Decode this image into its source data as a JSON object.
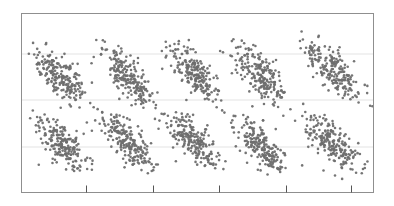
{
  "chart_data": {
    "type": "scatter",
    "title": "",
    "subtitle": "",
    "xlabel": "",
    "ylabel": "",
    "xlim": [
      0,
      100
    ],
    "ylim": [
      0,
      100
    ],
    "grid": true,
    "grid_axis": "y",
    "grid_color": "#e3e3e3",
    "legend": null,
    "legend_position": "none",
    "xticklabels": [],
    "yticklabels": [],
    "marker": {
      "shape": "circle",
      "color": "#6e6e6e",
      "size_px": 2.6,
      "opacity": 0.95
    },
    "frame": {
      "border_color": "#8f8f8f",
      "border_width": 1,
      "left_px": 21,
      "top_px": 13,
      "right_px": 374,
      "bottom_px": 193
    },
    "x_ticks_px": [
      86,
      153,
      219,
      286,
      351
    ],
    "x_tick_direction": "inward",
    "x_tick_length_px": 7,
    "y_gridlines_px": [
      54,
      100,
      147
    ],
    "n_points": 2100,
    "cycles": 5,
    "period_px": 66,
    "series": [
      {
        "name": "points",
        "color": "#6e6e6e",
        "bands": [
          {
            "band": "upper",
            "cycle": 1,
            "x_start_px": 28,
            "x_end_px": 95,
            "y_start_px": 48,
            "y_end_px": 108
          },
          {
            "band": "lower",
            "cycle": 1,
            "x_start_px": 28,
            "x_end_px": 95,
            "y_start_px": 112,
            "y_end_px": 175
          },
          {
            "band": "upper",
            "cycle": 2,
            "x_start_px": 94,
            "x_end_px": 161,
            "y_start_px": 42,
            "y_end_px": 108
          },
          {
            "band": "lower",
            "cycle": 2,
            "x_start_px": 94,
            "x_end_px": 161,
            "y_start_px": 110,
            "y_end_px": 172
          },
          {
            "band": "upper",
            "cycle": 3,
            "x_start_px": 160,
            "x_end_px": 227,
            "y_start_px": 42,
            "y_end_px": 108
          },
          {
            "band": "lower",
            "cycle": 3,
            "x_start_px": 160,
            "x_end_px": 227,
            "y_start_px": 110,
            "y_end_px": 172
          },
          {
            "band": "upper",
            "cycle": 4,
            "x_start_px": 226,
            "x_end_px": 293,
            "y_start_px": 40,
            "y_end_px": 108
          },
          {
            "band": "lower",
            "cycle": 4,
            "x_start_px": 226,
            "x_end_px": 293,
            "y_start_px": 110,
            "y_end_px": 178
          },
          {
            "band": "upper",
            "cycle": 5,
            "x_start_px": 292,
            "x_end_px": 374,
            "y_start_px": 33,
            "y_end_px": 108
          },
          {
            "band": "lower",
            "cycle": 5,
            "x_start_px": 292,
            "x_end_px": 374,
            "y_start_px": 110,
            "y_end_px": 178
          }
        ]
      }
    ]
  }
}
